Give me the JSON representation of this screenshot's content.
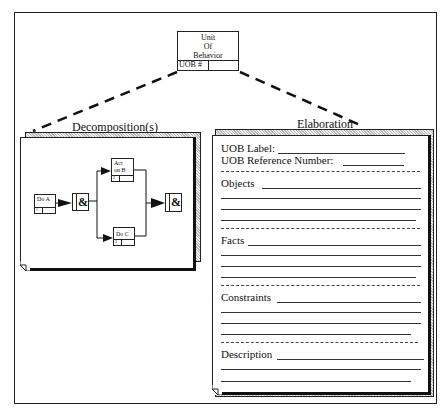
{
  "unit_of_behavior": {
    "line1": "Unit",
    "line2": "Of",
    "line3": "Behavior",
    "id_label": "UOB #"
  },
  "decomposition": {
    "title": "Decomposition(s)",
    "blocks": [
      {
        "name": "Do A",
        "number": "1"
      },
      {
        "name": "Act on B",
        "line1": "Act",
        "line2": "on B",
        "number": "2"
      },
      {
        "name": "Do  C",
        "number": "3"
      }
    ],
    "junction_symbol": "&"
  },
  "elaboration": {
    "title": "Elaboration",
    "uob_label": "UOB Label:",
    "uob_reference_number": "UOB Reference Number:",
    "sections": [
      {
        "label": "Objects"
      },
      {
        "label": "Facts"
      },
      {
        "label": "Constraints"
      },
      {
        "label": "Description"
      }
    ]
  }
}
